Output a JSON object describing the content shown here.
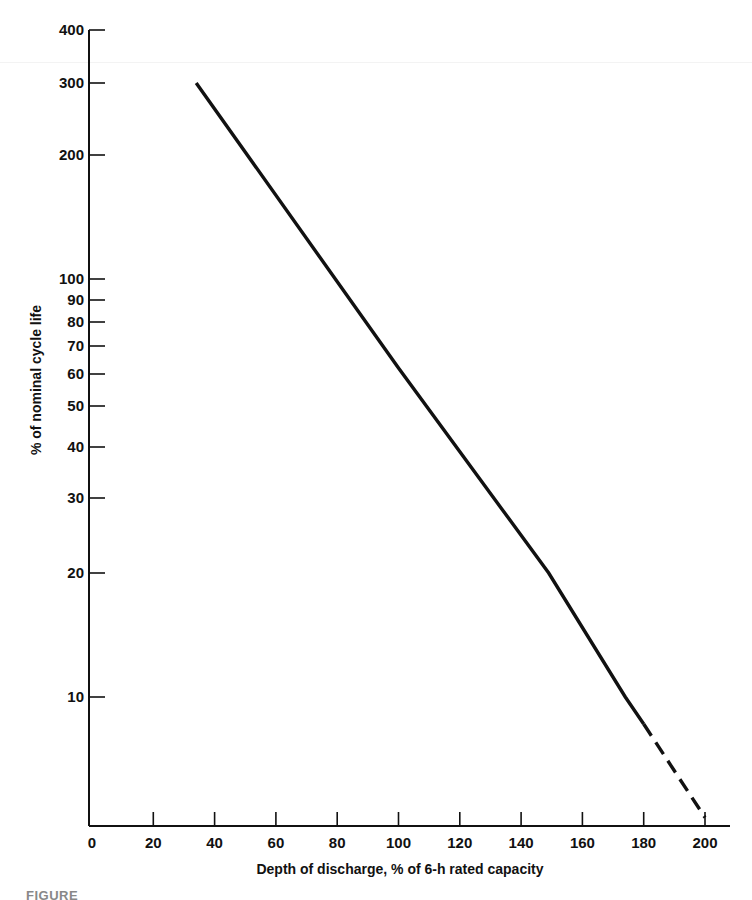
{
  "chart_data": {
    "type": "line",
    "title": "",
    "xlabel": "Depth of discharge, % of 6-h rated capacity",
    "ylabel": "% of nominal cycle life",
    "x_scale": "linear",
    "y_scale": "log",
    "xlim": [
      0,
      205
    ],
    "ylim": [
      5,
      400
    ],
    "grid": false,
    "legend": null,
    "x_ticks": [
      0,
      20,
      40,
      60,
      80,
      100,
      120,
      140,
      160,
      180,
      200
    ],
    "y_ticks": [
      10,
      20,
      30,
      40,
      50,
      60,
      70,
      80,
      90,
      100,
      200,
      300,
      400
    ],
    "series": [
      {
        "name": "Cycle life vs depth of discharge (measured)",
        "style": "solid",
        "x": [
          34,
          100,
          149,
          174,
          180
        ],
        "y": [
          300,
          62,
          20,
          10,
          8.6
        ]
      },
      {
        "name": "Cycle life vs depth of discharge (extrapolated)",
        "style": "dashed",
        "x": [
          180,
          200
        ],
        "y": [
          8.6,
          5.1
        ]
      }
    ]
  },
  "caption": {
    "text": "FIGURE"
  }
}
